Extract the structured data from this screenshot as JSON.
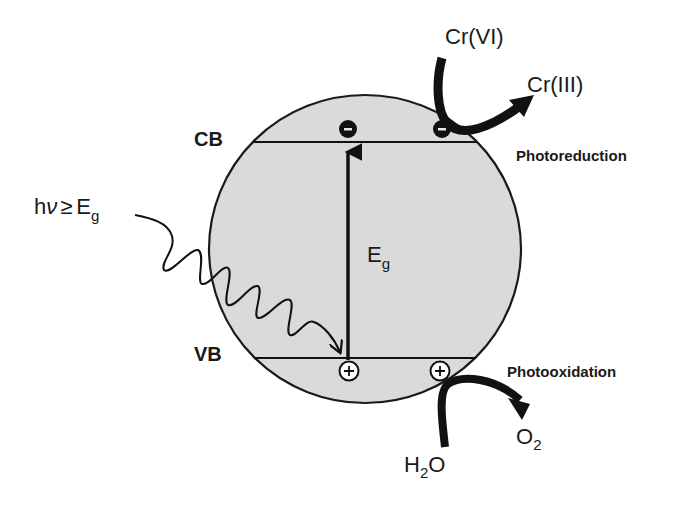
{
  "diagram": {
    "type": "photocatalysis-band-diagram",
    "particle": {
      "fill": "#d9d9d9",
      "stroke": "#1a1a1a"
    },
    "bands": {
      "conduction": {
        "label": "CB"
      },
      "valence": {
        "label": "VB"
      }
    },
    "band_gap": {
      "symbol": "E",
      "subscript": "g"
    },
    "photon": {
      "prefix": "h",
      "nu": "ν",
      "relation": "≥",
      "symbol": "E",
      "subscript": "g"
    },
    "carriers": {
      "electron_symbol": "−",
      "hole_symbol": "+"
    },
    "reduction": {
      "reactant": "Cr(VI)",
      "product": "Cr(III)",
      "process": "Photoreduction"
    },
    "oxidation": {
      "reactant_main": "H",
      "reactant_sub": "2",
      "reactant_tail": "O",
      "product_main": "O",
      "product_sub": "2",
      "process": "Photooxidation"
    }
  }
}
